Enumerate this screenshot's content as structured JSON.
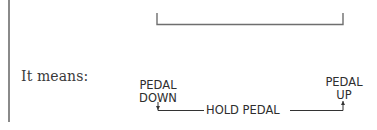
{
  "notation": {
    "prefix_label": "It means:",
    "start_label_line1": "PEDAL",
    "start_label_line2": "DOWN",
    "end_label_line1": "PEDAL",
    "end_label_line2": "UP",
    "middle_label": "HOLD PEDAL"
  },
  "colors": {
    "line": "#8a8a8a",
    "text": "#2e2e2e",
    "serif_text": "#3a3a3a"
  }
}
